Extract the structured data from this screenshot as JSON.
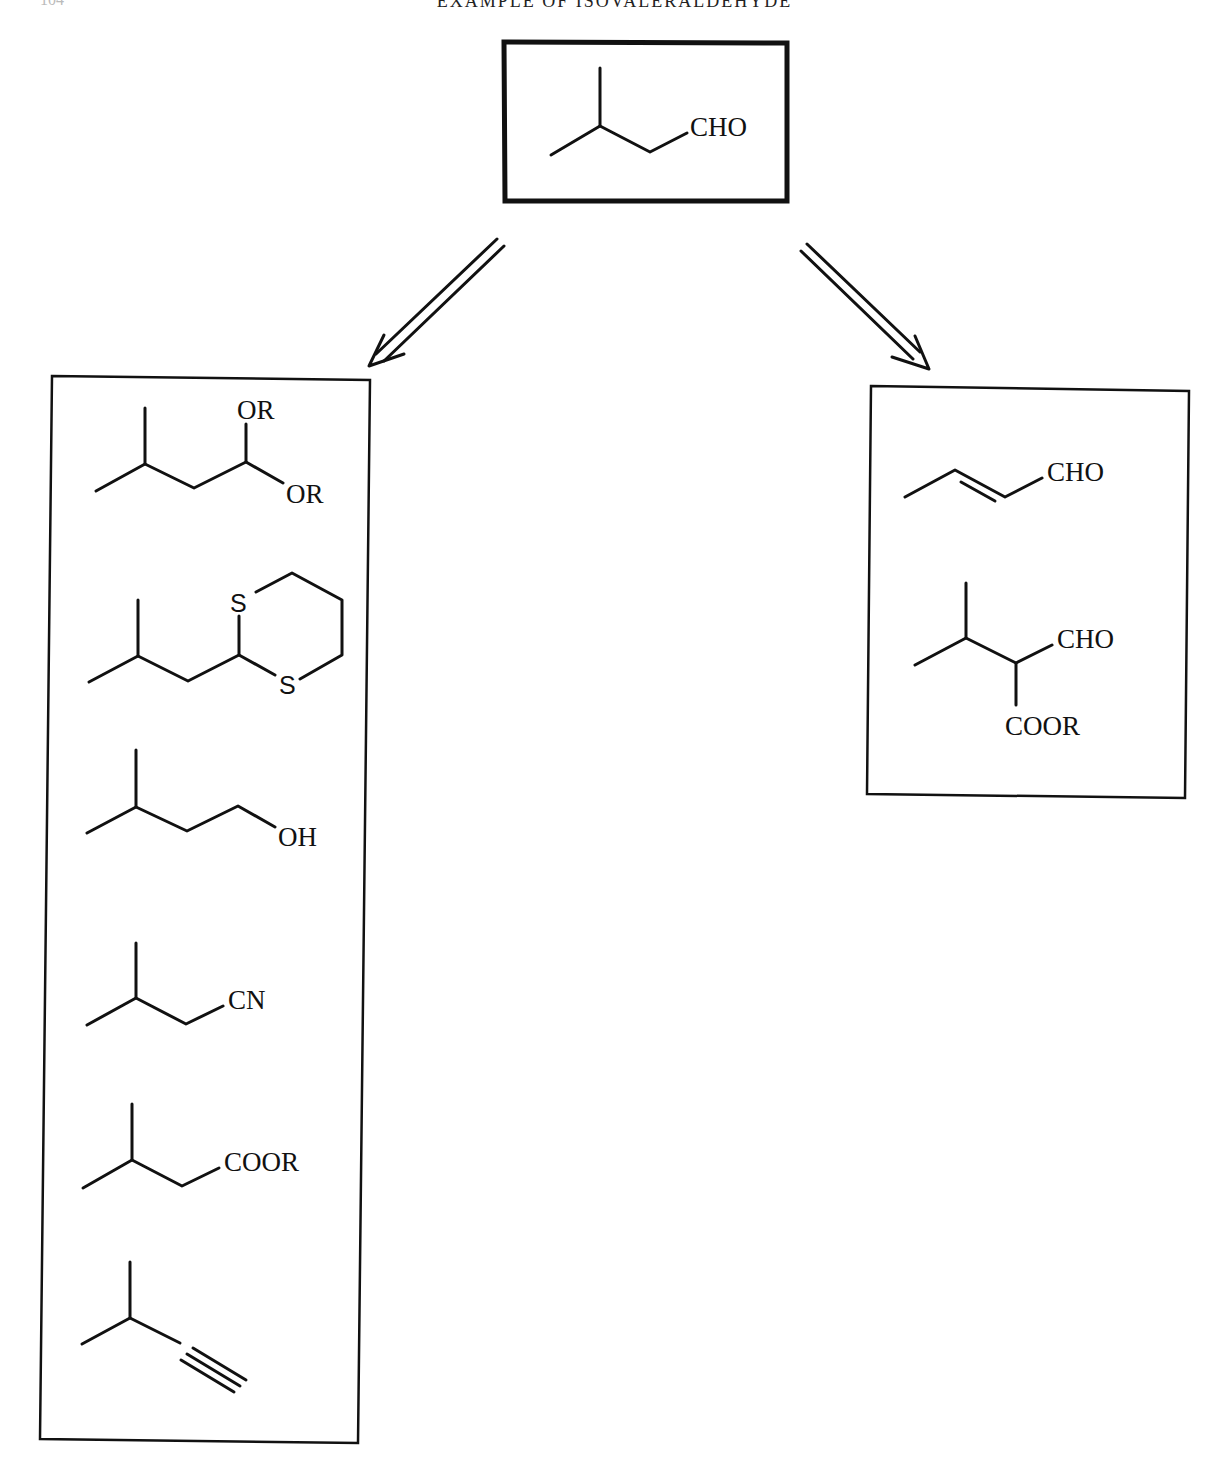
{
  "header": {
    "running_title": "EXAMPLE OF ISOVALERALDEHYDE",
    "page_number": "104"
  },
  "target": {
    "name": "isovaleraldehyde",
    "group_label": "CHO"
  },
  "arrows": [
    {
      "type": "retrosynthetic-double-arrow",
      "direction": "down-left"
    },
    {
      "type": "retrosynthetic-double-arrow",
      "direction": "down-right"
    }
  ],
  "left_box": {
    "title": "functional group equivalents",
    "structures": [
      {
        "name": "acetal",
        "labels": [
          "OR",
          "OR"
        ]
      },
      {
        "name": "1,3-dithiane",
        "labels": [
          "S",
          "S"
        ]
      },
      {
        "name": "alcohol",
        "labels": [
          "OH"
        ]
      },
      {
        "name": "nitrile",
        "labels": [
          "CN"
        ]
      },
      {
        "name": "ester",
        "labels": [
          "COOR"
        ]
      },
      {
        "name": "alkyne",
        "labels": []
      }
    ]
  },
  "right_box": {
    "title": "precursors",
    "structures": [
      {
        "name": "crotonaldehyde",
        "labels": [
          "CHO"
        ]
      },
      {
        "name": "formyl-ester",
        "labels": [
          "CHO",
          "COOR"
        ]
      }
    ]
  },
  "colors": {
    "ink": "#111111",
    "background": "#ffffff"
  }
}
